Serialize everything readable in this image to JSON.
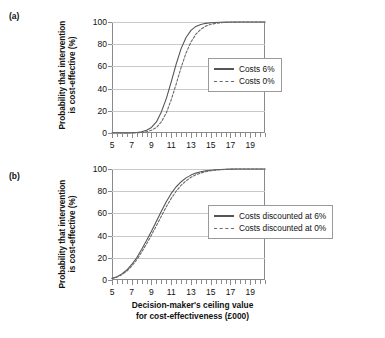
{
  "figure": {
    "panels": [
      {
        "id": "a",
        "label": "(a)",
        "ylabel_line1": "Probability that intervention",
        "ylabel_line2": "is cost-effective (%)",
        "legend": [
          {
            "label": "Costs 6%",
            "style": "solid"
          },
          {
            "label": "Costs 0%",
            "style": "dashed"
          }
        ]
      },
      {
        "id": "b",
        "label": "(b)",
        "ylabel_line1": "Probability that intervention",
        "ylabel_line2": "is cost-effective (%)",
        "legend": [
          {
            "label": "Costs discounted at 6%",
            "style": "solid"
          },
          {
            "label": "Costs discounted at 0%",
            "style": "dashed"
          }
        ]
      }
    ],
    "xtitle_line1": "Decision-maker's ceiling value",
    "xtitle_line2": "for cost-effectiveness (£000)",
    "colors": {
      "curve_solid": "#555555",
      "curve_dashed": "#6a6a6a",
      "axis": "#8a8a8a",
      "grid": "#c9c9c9",
      "text": "#111111",
      "background": "#ffffff"
    }
  },
  "chart_data": [
    {
      "type": "line",
      "panel": "(a)",
      "title": "",
      "xlabel": "Decision-maker's ceiling value for cost-effectiveness (£000)",
      "ylabel": "Probability that intervention is cost-effective (%)",
      "xlim": [
        5,
        20.5
      ],
      "ylim": [
        0,
        100
      ],
      "xticks": [
        5,
        7,
        9,
        11,
        13,
        15,
        17,
        19
      ],
      "xtick_labels": [
        "5",
        "7",
        "9",
        "11",
        "13",
        "15",
        "17",
        "19"
      ],
      "xtick_minor_step": 0.5,
      "yticks": [
        0,
        20,
        40,
        60,
        80,
        100
      ],
      "ytick_labels": [
        "0",
        "20",
        "40",
        "60",
        "80",
        "100"
      ],
      "grid": "horizontal",
      "legend_position": "right-middle",
      "x": [
        5,
        5.5,
        6,
        6.5,
        7,
        7.5,
        8,
        8.5,
        9,
        9.5,
        10,
        10.5,
        11,
        11.5,
        12,
        12.5,
        13,
        13.5,
        14,
        14.5,
        15,
        15.5,
        16,
        16.5,
        17,
        17.5,
        18,
        18.5,
        19,
        19.5,
        20,
        20.5
      ],
      "series": [
        {
          "name": "Costs 6%",
          "style": "solid",
          "values": [
            0,
            0,
            0,
            0,
            0.2,
            0.5,
            1.2,
            2.5,
            5,
            10,
            19,
            31,
            46,
            62,
            76,
            86,
            92.5,
            96,
            97.8,
            98.8,
            99.3,
            99.6,
            99.8,
            99.9,
            100,
            100,
            100,
            100,
            100,
            100,
            100,
            100
          ]
        },
        {
          "name": "Costs 0%",
          "style": "dashed",
          "values": [
            0,
            0,
            0,
            0,
            0,
            0.2,
            0.5,
            1.2,
            2.5,
            5,
            10,
            18,
            30,
            44,
            59,
            72,
            82,
            89,
            93.5,
            96.3,
            97.9,
            98.8,
            99.3,
            99.6,
            99.8,
            99.9,
            100,
            100,
            100,
            100,
            100,
            100
          ]
        }
      ]
    },
    {
      "type": "line",
      "panel": "(b)",
      "title": "",
      "xlabel": "Decision-maker's ceiling value for cost-effectiveness (£000)",
      "ylabel": "Probability that intervention is cost-effective (%)",
      "xlim": [
        5,
        20.5
      ],
      "ylim": [
        0,
        100
      ],
      "xticks": [
        5,
        7,
        9,
        11,
        13,
        15,
        17,
        19
      ],
      "xtick_labels": [
        "5",
        "7",
        "9",
        "11",
        "13",
        "15",
        "17",
        "19"
      ],
      "xtick_minor_step": 0.5,
      "yticks": [
        0,
        20,
        40,
        60,
        80,
        100
      ],
      "ytick_labels": [
        "0",
        "20",
        "40",
        "60",
        "80",
        "100"
      ],
      "grid": "horizontal",
      "legend_position": "right-middle",
      "x": [
        5,
        5.5,
        6,
        6.5,
        7,
        7.5,
        8,
        8.5,
        9,
        9.5,
        10,
        10.5,
        11,
        11.5,
        12,
        12.5,
        13,
        13.5,
        14,
        14.5,
        15,
        15.5,
        16,
        16.5,
        17,
        17.5,
        18,
        18.5,
        19,
        19.5,
        20,
        20.5
      ],
      "series": [
        {
          "name": "Costs discounted at 6%",
          "style": "solid",
          "values": [
            1.5,
            3,
            5.5,
            9,
            14,
            20,
            27.5,
            35.5,
            44,
            53,
            62,
            70.5,
            78,
            84,
            88.5,
            92,
            94.5,
            96.3,
            97.5,
            98.3,
            98.9,
            99.3,
            99.6,
            99.8,
            99.9,
            100,
            100,
            100,
            100,
            100,
            100,
            100
          ]
        },
        {
          "name": "Costs discounted at 0%",
          "style": "dashed",
          "values": [
            1.2,
            2.6,
            4.8,
            8,
            12.5,
            18,
            25,
            32.5,
            40.5,
            49,
            57.5,
            66,
            73.5,
            80,
            85.3,
            89.3,
            92.5,
            94.8,
            96.4,
            97.6,
            98.4,
            99,
            99.4,
            99.6,
            99.8,
            99.9,
            100,
            100,
            100,
            100,
            100,
            100
          ]
        }
      ]
    }
  ]
}
